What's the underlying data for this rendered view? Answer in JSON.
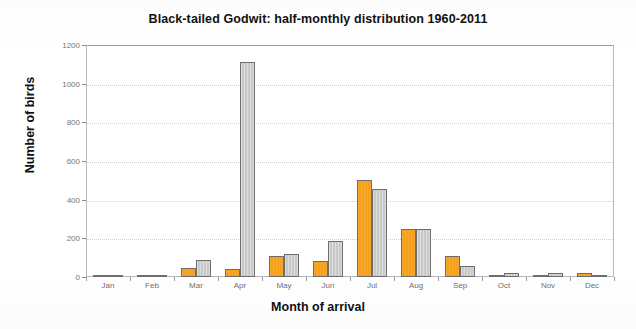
{
  "chart_data": {
    "type": "bar",
    "title": "Black-tailed Godwit: half-monthly distribution 1960-2011",
    "xlabel": "Month of arrival",
    "ylabel": "Number of birds",
    "categories": [
      "Jan",
      "Feb",
      "Mar",
      "Apr",
      "May",
      "Jun",
      "Jul",
      "Aug",
      "Sep",
      "Oct",
      "Nov",
      "Dec"
    ],
    "series": [
      {
        "name": "first half-month",
        "color": "#f6a01c",
        "values": [
          4,
          4,
          45,
          40,
          110,
          85,
          500,
          250,
          110,
          5,
          5,
          20
        ]
      },
      {
        "name": "second half-month",
        "color": "#c9c9c9",
        "values": [
          3,
          3,
          90,
          1110,
          120,
          185,
          455,
          250,
          55,
          20,
          20,
          5
        ]
      }
    ],
    "ylim": [
      0,
      1200
    ],
    "yticks": [
      0,
      200,
      400,
      600,
      800,
      1000,
      1200
    ],
    "ytick_labels": [
      "0",
      "200",
      "400",
      "600",
      "800",
      "1000",
      "1200"
    ],
    "grid": "horizontal-dotted",
    "legend": "none",
    "bar_border_color": "#5b5b5b",
    "plot_background": "#ffffff"
  }
}
